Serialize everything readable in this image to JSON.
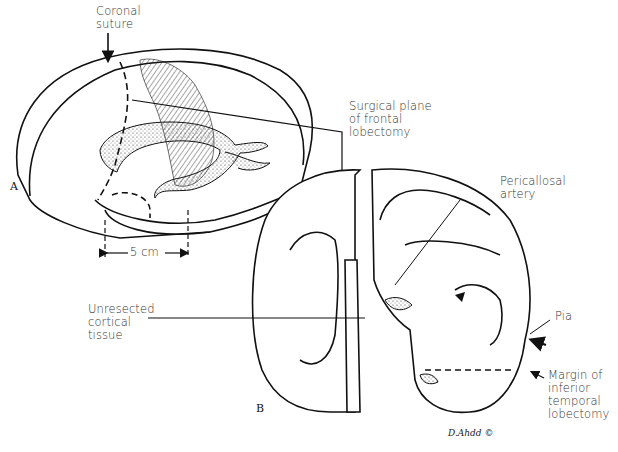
{
  "figure": {
    "panels": [
      {
        "id": "A",
        "label": "A",
        "view": "lateral view of brain"
      },
      {
        "id": "B",
        "label": "B",
        "view": "coronal section"
      }
    ],
    "labels": {
      "coronal_suture": "Coronal\nsuture",
      "measure": "5 cm",
      "surgical_plane": "Surgical plane\nof frontal\nlobectomy",
      "pericallosal": "Pericallosal\nartery",
      "unresected": "Unresected\ncortical\ntissue",
      "pia": "Pia",
      "margin": "Margin of\ninferior\ntemporal\nlobectomy"
    },
    "signature": "D.Ahdd ©",
    "colors": {
      "line": "#111111",
      "label_text": "#333333",
      "background": "#ffffff"
    }
  }
}
